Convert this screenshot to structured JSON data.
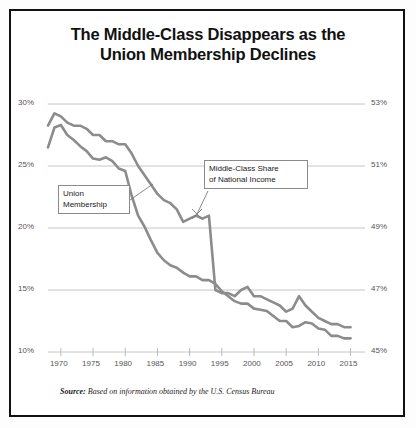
{
  "figure": {
    "title_line1": "The Middle-Class Disappears as the",
    "title_line2": "Union Membership Declines",
    "source_prefix": "Source:",
    "source_text": " Based on information obtained by the U.S. Census Bureau",
    "border_color": "#111111",
    "background": "#ffffff"
  },
  "annotations": {
    "union": {
      "line1": "Union",
      "line2": "Membership"
    },
    "middle_class": {
      "line1": "Middle-Class Share",
      "line2": "of National Income"
    }
  },
  "chart_data": {
    "type": "line",
    "title": "The Middle-Class Disappears as the Union Membership Declines",
    "xlabel": "",
    "ylabel": "Union Membership (%)",
    "y2label": "Middle-Class Share of National Income (%)",
    "grid": true,
    "legend_position": "inline-annotations",
    "xlim": [
      1968,
      2016
    ],
    "ylim": [
      10,
      30
    ],
    "y2lim": [
      45,
      53
    ],
    "xticks": [
      1970,
      1975,
      1980,
      1985,
      1990,
      1995,
      2000,
      2005,
      2010,
      2015
    ],
    "xticklabels": [
      "1970",
      "1975",
      "1980",
      "1985",
      "1990",
      "1995",
      "2000",
      "2005",
      "2010",
      "2015"
    ],
    "yticks": [
      10,
      15,
      20,
      25,
      30
    ],
    "yticklabels": [
      "10%",
      "15%",
      "20%",
      "25%",
      "30%"
    ],
    "y2ticks": [
      45,
      47,
      49,
      51,
      53
    ],
    "y2ticklabels": [
      "45%",
      "47%",
      "49%",
      "51%",
      "53%"
    ],
    "line_color": "#8c8c8c",
    "grid_color": "#cccccc",
    "series": [
      {
        "name": "Union Membership",
        "axis": "left",
        "x": [
          1968,
          1969,
          1970,
          1971,
          1972,
          1973,
          1974,
          1975,
          1976,
          1977,
          1978,
          1979,
          1980,
          1981,
          1982,
          1983,
          1984,
          1985,
          1986,
          1987,
          1988,
          1989,
          1990,
          1991,
          1992,
          1993,
          1994,
          1995,
          1996,
          1997,
          1998,
          1999,
          2000,
          2001,
          2002,
          2003,
          2004,
          2005,
          2006,
          2007,
          2008,
          2009,
          2010,
          2011,
          2012,
          2013,
          2014,
          2015
        ],
        "values": [
          26.5,
          28.1,
          28.3,
          27.5,
          27.1,
          26.6,
          26.2,
          25.6,
          25.5,
          25.7,
          25.4,
          24.8,
          24.6,
          22.6,
          21.0,
          20.1,
          19.0,
          18.0,
          17.4,
          17.0,
          16.8,
          16.4,
          16.1,
          16.1,
          15.8,
          15.8,
          15.5,
          14.9,
          14.5,
          14.1,
          13.9,
          13.9,
          13.5,
          13.4,
          13.3,
          12.9,
          12.5,
          12.5,
          12.0,
          12.1,
          12.4,
          12.3,
          11.9,
          11.8,
          11.3,
          11.3,
          11.1,
          11.1
        ]
      },
      {
        "name": "Middle-Class Share of National Income",
        "axis": "right",
        "x": [
          1968,
          1969,
          1970,
          1971,
          1972,
          1973,
          1974,
          1975,
          1976,
          1977,
          1978,
          1979,
          1980,
          1981,
          1982,
          1983,
          1984,
          1985,
          1986,
          1987,
          1988,
          1989,
          1990,
          1991,
          1992,
          1993,
          1994,
          1995,
          1996,
          1997,
          1998,
          1999,
          2000,
          2001,
          2002,
          2003,
          2004,
          2005,
          2006,
          2007,
          2008,
          2009,
          2010,
          2011,
          2012,
          2013,
          2014,
          2015
        ],
        "values": [
          52.3,
          52.7,
          52.6,
          52.4,
          52.3,
          52.3,
          52.2,
          52.0,
          52.0,
          51.8,
          51.8,
          51.7,
          51.7,
          51.4,
          51.0,
          50.7,
          50.4,
          50.1,
          49.9,
          49.8,
          49.6,
          49.2,
          49.3,
          49.4,
          49.3,
          49.4,
          47.0,
          46.9,
          46.9,
          46.8,
          47.0,
          47.1,
          46.8,
          46.8,
          46.7,
          46.6,
          46.5,
          46.3,
          46.4,
          46.8,
          46.5,
          46.3,
          46.1,
          46.0,
          45.9,
          45.9,
          45.8,
          45.8
        ]
      }
    ]
  }
}
